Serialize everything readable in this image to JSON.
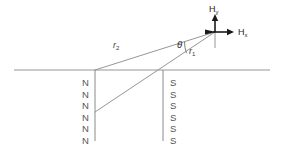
{
  "figure": {
    "background_color": "#ffffff",
    "line_color": "#8a8a8a",
    "arrow_color": "#1a1a1a",
    "text_color": "#3a3a3a"
  },
  "ground_line": {
    "name": "surface-line",
    "x1": 14,
    "y1": 70,
    "x2": 270,
    "y2": 70
  },
  "field_point": {
    "x": 215,
    "y": 32
  },
  "north_pole": {
    "label_letter": "N",
    "count": 6,
    "letters": [
      "N",
      "N",
      "N",
      "N",
      "N",
      "N"
    ],
    "line_x": 95,
    "line_y_top": 70,
    "line_y_bottom": 141,
    "letter_x": 82,
    "letter_y_start": 82,
    "letter_spacing": 11.6
  },
  "south_pole": {
    "label_letter": "S",
    "count": 6,
    "letters": [
      "S",
      "S",
      "S",
      "S",
      "S",
      "S"
    ],
    "line_x": 163,
    "line_y_top": 70,
    "line_y_bottom": 141,
    "letter_x": 170,
    "letter_y_start": 82,
    "letter_spacing": 11.6
  },
  "rays": {
    "r2": {
      "label": "r",
      "subscript": "2",
      "from_x": 95,
      "from_y": 70,
      "to_x": 215,
      "to_y": 32,
      "label_x": 113,
      "label_y": 48
    },
    "r1": {
      "label": "r",
      "subscript": "1",
      "from_x": 95,
      "from_y": 112,
      "to_x": 215,
      "to_y": 32,
      "label_x": 189,
      "label_y": 54
    }
  },
  "angle": {
    "symbol": "θ",
    "label_x": 178,
    "label_y": 47
  },
  "field_vectors": {
    "hy": {
      "label": "H",
      "subscript": "y",
      "label_x": 210,
      "label_y": 12,
      "tip_x": 215,
      "tip_y": 16,
      "tail_x": 215,
      "tail_y": 32
    },
    "hx": {
      "label": "H",
      "subscript": "x",
      "label_x": 235,
      "label_y": 35,
      "tip_x": 232,
      "tip_y": 32,
      "tail_x": 215,
      "tail_y": 32
    }
  }
}
